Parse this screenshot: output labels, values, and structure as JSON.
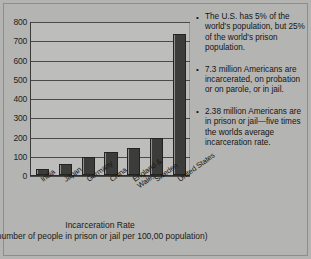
{
  "slide": {
    "background_color": "#b4b4b2",
    "border_color": "#8d8d8b"
  },
  "chart_data": {
    "type": "bar",
    "title": "Incarceration Rate",
    "subtitle": "(number of people in prison or jail per 100,00 population)",
    "xlabel": "",
    "ylabel": "",
    "ylim": [
      0,
      800
    ],
    "ytick_step": 100,
    "grid": true,
    "legend": "none",
    "bar_color": "#3c3c3a",
    "categories": [
      "India",
      "Japan",
      "Germany",
      "China",
      "England & Wales",
      "Sweden",
      "United States"
    ],
    "values": [
      30,
      55,
      95,
      120,
      140,
      190,
      730
    ],
    "yticks": [
      "0",
      "100",
      "200",
      "300",
      "400",
      "500",
      "600",
      "700",
      "800"
    ]
  },
  "bullets": [
    {
      "marker": "•",
      "text": "The U.S. has 5% of the world's population, but 25% of the world's prison population."
    },
    {
      "marker": "•",
      "text": "7.3 million Americans are incarcerated, on probation or on parole, or in jail."
    },
    {
      "marker": "•",
      "text": "2.38 million Americans are in prison or jail—five times the worlds average incarceration rate."
    }
  ]
}
